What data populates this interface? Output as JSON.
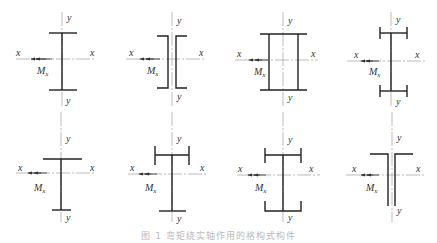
{
  "figure": {
    "caption": "图 1   弯矩绕实轴作用的格构式构件",
    "axis_labels": {
      "x": "x",
      "y": "y",
      "moment": "M",
      "moment_sub": "x"
    },
    "panels": [
      {
        "id": 1,
        "shape": "I-section (wide flange, symmetric)"
      },
      {
        "id": 2,
        "shape": "double channel back-to-back"
      },
      {
        "id": 3,
        "shape": "box section (flanges extended)"
      },
      {
        "id": 4,
        "shape": "web with lipped flanges (symmetric)"
      },
      {
        "id": 5,
        "shape": "mono-symmetric I (wide top flange)"
      },
      {
        "id": 6,
        "shape": "mono-symmetric I (lipped top flange)"
      },
      {
        "id": 7,
        "shape": "I with lipped top and channel bottom"
      },
      {
        "id": 8,
        "shape": "double angle T-section"
      }
    ]
  }
}
